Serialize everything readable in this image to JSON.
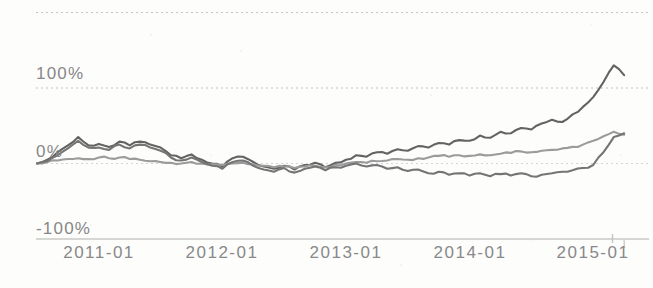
{
  "chart_data": {
    "type": "line",
    "title": "",
    "x_unit": "month",
    "x_start": "2010-07",
    "x_end": "2015-04",
    "n_points": 58,
    "x_tick_labels": [
      "2011-01",
      "2012-01",
      "2013-01",
      "2014-01",
      "2015-01"
    ],
    "x_tick_month_indices": [
      6,
      18,
      30,
      42,
      54
    ],
    "y_tick_labels": [
      "100%",
      "0%",
      "-100%"
    ],
    "ylim": [
      -100,
      200
    ],
    "labeled_gridlines": [
      100,
      0,
      -100
    ],
    "unlabeled_gridlines": [
      200
    ],
    "grid": true,
    "legend": "none",
    "series": [
      {
        "name": "series-1",
        "color": "#646464",
        "values": [
          0,
          5,
          15,
          24,
          35,
          24,
          26,
          22,
          29,
          24,
          29,
          25,
          21,
          11,
          7,
          12,
          5,
          0,
          -4,
          7,
          9,
          2,
          -4,
          -7,
          -3,
          -8,
          -2,
          1,
          -5,
          1,
          5,
          11,
          9,
          15,
          13,
          19,
          17,
          23,
          21,
          27,
          25,
          31,
          30,
          37,
          34,
          42,
          40,
          47,
          45,
          53,
          58,
          55,
          65,
          75,
          88,
          108,
          130,
          117
        ]
      },
      {
        "name": "series-2",
        "color": "#9b9b9b",
        "values": [
          0,
          2,
          4,
          6,
          7,
          6,
          8,
          7,
          8,
          6,
          5,
          3,
          2,
          1,
          0,
          2,
          0,
          -1,
          -2,
          0,
          1,
          -1,
          -3,
          -5,
          -4,
          -6,
          -4,
          -3,
          -5,
          -2,
          0,
          2,
          1,
          3,
          4,
          6,
          5,
          7,
          8,
          10,
          9,
          11,
          10,
          12,
          11,
          13,
          14,
          16,
          15,
          17,
          18,
          20,
          22,
          25,
          30,
          36,
          42,
          38
        ]
      },
      {
        "name": "series-3",
        "color": "#747474",
        "values": [
          0,
          3,
          11,
          20,
          30,
          21,
          21,
          18,
          25,
          20,
          25,
          21,
          17,
          8,
          4,
          8,
          2,
          -3,
          -7,
          2,
          4,
          -3,
          -8,
          -11,
          -6,
          -12,
          -7,
          -4,
          -9,
          -5,
          -3,
          0,
          -4,
          -2,
          -7,
          -5,
          -10,
          -8,
          -13,
          -11,
          -15,
          -13,
          -16,
          -13,
          -17,
          -14,
          -16,
          -13,
          -17,
          -15,
          -13,
          -11,
          -9,
          -6,
          -2,
          15,
          35,
          40
        ]
      }
    ]
  },
  "style": {
    "grid_color": "#c9c9c9",
    "dotted_grid_color": "#c2c2c2",
    "faint_grid_color": "#d4d4d4",
    "tick_label_color": "#878787",
    "background": "#fdfdfc"
  }
}
